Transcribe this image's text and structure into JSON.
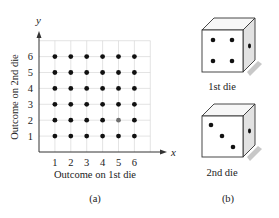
{
  "figure": {
    "panel_a": {
      "caption": "(a)",
      "x_axis_symbol": "x",
      "y_axis_symbol": "y",
      "x_label": "Outcome on 1st die",
      "y_label": "Outcome on 2nd die",
      "x_ticks": [
        "1",
        "2",
        "3",
        "4",
        "5",
        "6"
      ],
      "y_ticks": [
        "1",
        "2",
        "3",
        "4",
        "5",
        "6"
      ],
      "highlighted_point": {
        "x": 5,
        "y": 2,
        "color": "#6e6e6e"
      },
      "point_color": "#111111",
      "grid_color": "#d9d9d9"
    },
    "panel_b": {
      "caption": "(b)",
      "die1": {
        "label": "1st die",
        "face_value": 4,
        "side_value": 1
      },
      "die2": {
        "label": "2nd die",
        "face_value": 3,
        "side_value": 1
      }
    }
  },
  "chart_data": {
    "type": "scatter",
    "title": "",
    "xlabel": "Outcome on 1st die",
    "ylabel": "Outcome on 2nd die",
    "xlim": [
      0,
      7
    ],
    "ylim": [
      0,
      7
    ],
    "grid": true,
    "x_ticks": [
      1,
      2,
      3,
      4,
      5,
      6
    ],
    "y_ticks": [
      1,
      2,
      3,
      4,
      5,
      6
    ],
    "points": [
      [
        1,
        1
      ],
      [
        2,
        1
      ],
      [
        3,
        1
      ],
      [
        4,
        1
      ],
      [
        5,
        1
      ],
      [
        6,
        1
      ],
      [
        1,
        2
      ],
      [
        2,
        2
      ],
      [
        3,
        2
      ],
      [
        4,
        2
      ],
      [
        5,
        2
      ],
      [
        6,
        2
      ],
      [
        1,
        3
      ],
      [
        2,
        3
      ],
      [
        3,
        3
      ],
      [
        4,
        3
      ],
      [
        5,
        3
      ],
      [
        6,
        3
      ],
      [
        1,
        4
      ],
      [
        2,
        4
      ],
      [
        3,
        4
      ],
      [
        4,
        4
      ],
      [
        5,
        4
      ],
      [
        6,
        4
      ],
      [
        1,
        5
      ],
      [
        2,
        5
      ],
      [
        3,
        5
      ],
      [
        4,
        5
      ],
      [
        5,
        5
      ],
      [
        6,
        5
      ],
      [
        1,
        6
      ],
      [
        2,
        6
      ],
      [
        3,
        6
      ],
      [
        4,
        6
      ],
      [
        5,
        6
      ],
      [
        6,
        6
      ]
    ],
    "highlighted": [
      [
        5,
        2
      ]
    ]
  }
}
